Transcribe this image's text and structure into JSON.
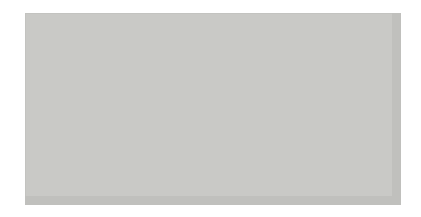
{
  "figure": {
    "kind": "go-board-diagram",
    "background_color": "#ffffff",
    "board_color": "#c9c9c6",
    "line_color": "#4a4a4a"
  },
  "board": {
    "origin_x": 38,
    "origin_y": 23,
    "spacing": 19.3,
    "columns": 19,
    "rows": 9,
    "stone_diameter": 21
  },
  "star_points": [
    {
      "name": "star-point-top-left",
      "col": 3,
      "row": 0
    },
    {
      "name": "star-point-top-center",
      "col": 9,
      "row": 0
    },
    {
      "name": "star-point-top-right",
      "col": 15,
      "row": 0
    },
    {
      "name": "star-point-mid-center",
      "col": 9,
      "row": 6
    },
    {
      "name": "star-point-mid-right",
      "col": 15,
      "row": 6
    }
  ],
  "stones": [
    {
      "name": "black-stone-a1",
      "color": "black",
      "col": 0,
      "row": 6
    },
    {
      "name": "black-stone-b1",
      "color": "black",
      "col": 1,
      "row": 6
    },
    {
      "name": "black-stone-c1",
      "color": "black",
      "col": 2,
      "row": 6
    },
    {
      "name": "black-stone-d1",
      "color": "black",
      "col": 3,
      "row": 6
    },
    {
      "name": "black-stone-e1",
      "color": "black",
      "col": 4,
      "row": 7
    },
    {
      "name": "black-stone-e2",
      "color": "black",
      "col": 4,
      "row": 8
    },
    {
      "name": "black-stone-e3",
      "color": "black",
      "col": 4,
      "row": 9
    },
    {
      "name": "white-stone-p1",
      "color": "white",
      "col": 15,
      "row": 7
    },
    {
      "name": "white-stone-p2",
      "color": "white",
      "col": 15,
      "row": 8
    },
    {
      "name": "white-stone-p3",
      "color": "white",
      "col": 15,
      "row": 9
    },
    {
      "name": "white-stone-q1",
      "color": "white",
      "col": 16,
      "row": 6
    },
    {
      "name": "white-stone-r1",
      "color": "white",
      "col": 17,
      "row": 6
    },
    {
      "name": "white-stone-s1",
      "color": "white",
      "col": 18,
      "row": 6
    }
  ],
  "labels": [
    {
      "name": "label-ga",
      "text": "가",
      "col": 1.3,
      "row": 8
    },
    {
      "name": "label-na",
      "text": "나",
      "col": 16.8,
      "row": 8
    }
  ]
}
